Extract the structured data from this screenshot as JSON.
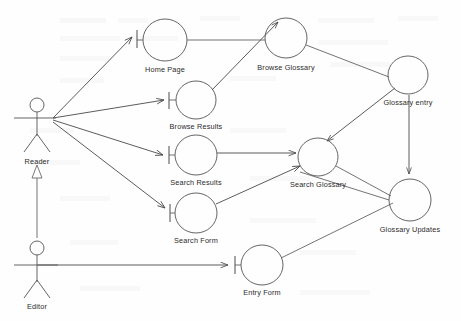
{
  "diagram": {
    "kind": "uml-use-case-diagram",
    "title": "",
    "background_color": "#fefefe",
    "line_color": "#5a5a5a",
    "text_color": "#2b2b2b",
    "actors": [
      {
        "id": "reader",
        "label": "Reader",
        "x": 37,
        "y": 118
      },
      {
        "id": "editor",
        "label": "Editor",
        "x": 37,
        "y": 265
      }
    ],
    "use_cases": [
      {
        "id": "home_page",
        "label": "Home Page",
        "x": 165,
        "y": 40,
        "rx": 22,
        "ry": 21
      },
      {
        "id": "browse_results",
        "label": "Browse Results",
        "x": 196,
        "y": 100,
        "rx": 20,
        "ry": 19
      },
      {
        "id": "search_results",
        "label": "Search Results",
        "x": 196,
        "y": 155,
        "rx": 21,
        "ry": 20
      },
      {
        "id": "search_form",
        "label": "Search Form",
        "x": 196,
        "y": 213,
        "rx": 21,
        "ry": 20
      },
      {
        "id": "browse_glossary",
        "label": "Browse Glossary",
        "x": 286,
        "y": 38,
        "rx": 21,
        "ry": 20
      },
      {
        "id": "glossary_entry",
        "label": "Glossary entry",
        "x": 408,
        "y": 75,
        "rx": 20,
        "ry": 19
      },
      {
        "id": "search_glossary",
        "label": "Search Glossary",
        "x": 318,
        "y": 157,
        "rx": 20,
        "ry": 19
      },
      {
        "id": "glossary_updates",
        "label": "Glossary Updates",
        "x": 410,
        "y": 200,
        "rx": 21,
        "ry": 21
      },
      {
        "id": "entry_form",
        "label": "Entry Form",
        "x": 262,
        "y": 265,
        "rx": 21,
        "ry": 20
      }
    ],
    "associations": [
      {
        "from": "reader",
        "to": "home_page",
        "type": "arrow-tick"
      },
      {
        "from": "reader",
        "to": "browse_results",
        "type": "arrow-tick"
      },
      {
        "from": "reader",
        "to": "search_results",
        "type": "arrow-tick"
      },
      {
        "from": "reader",
        "to": "search_form",
        "type": "arrow-tick"
      },
      {
        "from": "editor",
        "to": "entry_form",
        "type": "arrow-tick"
      },
      {
        "from": "home_page",
        "to": "browse_glossary",
        "type": "plain"
      },
      {
        "from": "browse_results",
        "to": "browse_glossary",
        "type": "arrow"
      },
      {
        "from": "browse_glossary",
        "to": "glossary_entry",
        "type": "plain"
      },
      {
        "from": "search_results",
        "to": "search_glossary",
        "type": "arrow"
      },
      {
        "from": "search_form",
        "to": "search_glossary",
        "type": "arrow"
      },
      {
        "from": "glossary_entry",
        "to": "search_glossary",
        "type": "arrow"
      },
      {
        "from": "glossary_entry",
        "to": "glossary_updates",
        "type": "arrow"
      },
      {
        "from": "search_glossary",
        "to": "glossary_updates",
        "type": "plain"
      },
      {
        "from": "entry_form",
        "to": "glossary_updates",
        "type": "plain"
      }
    ],
    "generalizations": [
      {
        "from": "editor",
        "to": "reader",
        "marker": "hollow-triangle",
        "x": 37,
        "y": 172
      }
    ]
  }
}
